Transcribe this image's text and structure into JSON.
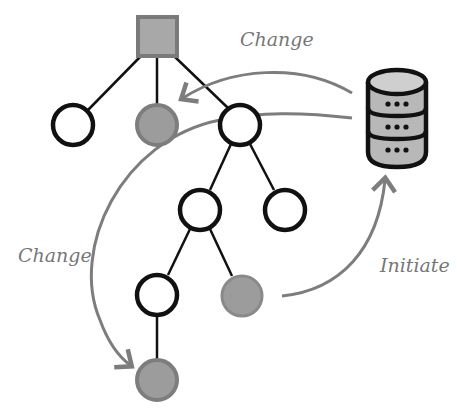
{
  "colors": {
    "edge": "#111111",
    "node_empty_stroke": "#111111",
    "node_empty_fill": "#ffffff",
    "node_changed_fill": "#9c9c9c",
    "node_changed_stroke": "#7d7d7d",
    "root_fill": "#a8a8a8",
    "root_stroke": "#7a7a7a",
    "arrow": "#7d7d7d",
    "db_fill": "#b8b8b8",
    "db_stroke": "#111111"
  },
  "labels": {
    "change_top": "Change",
    "change_left": "Change",
    "initiate": "Initiate"
  },
  "icons": {
    "root": "square-node",
    "database": "database-icon"
  }
}
